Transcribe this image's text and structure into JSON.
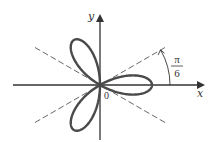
{
  "figure": {
    "type": "polar-rose",
    "equation_hint": "r = cos 3θ",
    "petals": 3,
    "axes": {
      "x_label": "x",
      "y_label": "y",
      "origin_label": "0"
    },
    "angle_annotation": {
      "numerator": "π",
      "denominator": "6"
    },
    "dashed_lines_angles": [
      "π/6",
      "-π/6"
    ],
    "colors": {
      "curve": "#4a4a4a",
      "axes": "#333333",
      "dashed": "#555555"
    }
  }
}
